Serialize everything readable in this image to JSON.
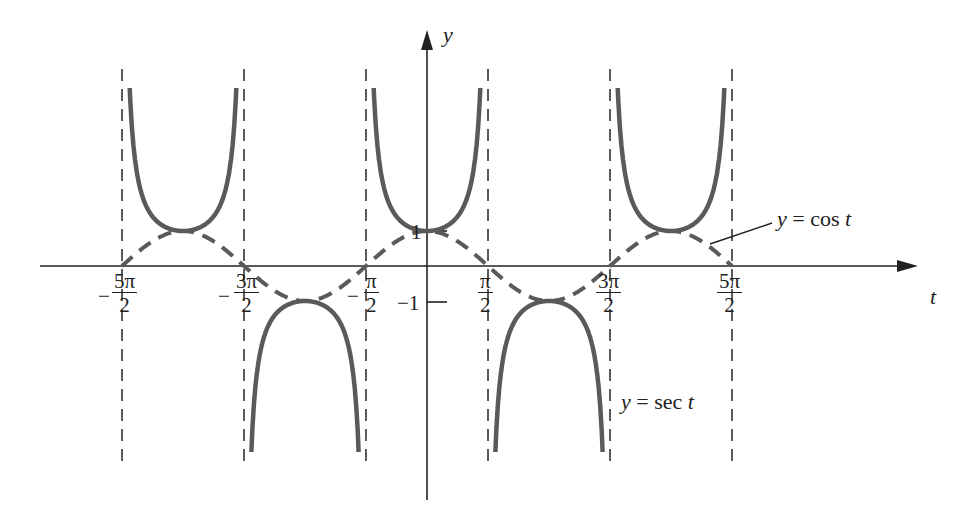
{
  "chart_data": {
    "type": "line",
    "title": "",
    "xlabel": "t",
    "ylabel": "y",
    "xlim": [
      -7.4,
      7.9
    ],
    "ylim": [
      -8.0,
      6.2
    ],
    "grid": false,
    "x_ticks": [
      "-5π/2",
      "-3π/2",
      "-π/2",
      "π/2",
      "3π/2",
      "5π/2"
    ],
    "y_ticks": [
      "1",
      "-1"
    ],
    "vertical_asymptotes": [
      "-5π/2",
      "-3π/2",
      "-π/2",
      "π/2",
      "3π/2",
      "5π/2"
    ],
    "series": [
      {
        "name": "y = sec t",
        "style": "solid",
        "color": "#5a5a5a",
        "expression": "sec(t)",
        "domain": [
          -7.854,
          7.854
        ],
        "branches": [
          {
            "interval": [
              "-5π/2",
              "-3π/2"
            ],
            "vertex": [
              -6.283,
              1
            ]
          },
          {
            "interval": [
              "-3π/2",
              "-π/2"
            ],
            "vertex": [
              -3.1416,
              -1
            ]
          },
          {
            "interval": [
              "-π/2",
              "π/2"
            ],
            "vertex": [
              0,
              1
            ]
          },
          {
            "interval": [
              "π/2",
              "3π/2"
            ],
            "vertex": [
              3.1416,
              -1
            ]
          },
          {
            "interval": [
              "3π/2",
              "5π/2"
            ],
            "vertex": [
              6.283,
              1
            ]
          }
        ]
      },
      {
        "name": "y = cos t",
        "style": "dashed",
        "color": "#5a5a5a",
        "expression": "cos(t)",
        "domain": [
          -7.854,
          7.854
        ],
        "x": [
          -7.854,
          -6.283,
          -4.712,
          -3.1416,
          -1.5708,
          0,
          1.5708,
          3.1416,
          4.712,
          6.283,
          7.854
        ],
        "values": [
          0,
          1,
          0,
          -1,
          0,
          1,
          0,
          -1,
          0,
          1,
          0
        ]
      }
    ],
    "annotations": [
      {
        "text": "y = cos t",
        "points_to": "cos curve near t≈7.2"
      },
      {
        "text": "y = sec t",
        "position": "below right, t≈5.8"
      }
    ]
  },
  "labels": {
    "y_axis": "y",
    "x_axis": "t",
    "cos_label": "y = cos t",
    "sec_label": "y = sec t",
    "tick_one": "1",
    "tick_neg_one": "−1",
    "minus": "−",
    "ticks": {
      "neg_5pi_2": {
        "num": "5π",
        "den": "2"
      },
      "neg_3pi_2": {
        "num": "3π",
        "den": "2"
      },
      "neg_pi_2": {
        "num": "π",
        "den": "2"
      },
      "pi_2": {
        "num": "π",
        "den": "2"
      },
      "3pi_2": {
        "num": "3π",
        "den": "2"
      },
      "5pi_2": {
        "num": "5π",
        "den": "2"
      }
    }
  }
}
